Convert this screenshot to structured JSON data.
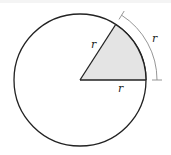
{
  "diagram": {
    "type": "circle-sector-radian",
    "circle": {
      "cx": 80,
      "cy": 80,
      "r": 66,
      "stroke": "#222222",
      "fill": "#ffffff"
    },
    "sector": {
      "angle_deg": 57.2958,
      "fill": "#e4e4e4",
      "stroke": "#222222"
    },
    "arc_marker": {
      "r": 77,
      "stroke": "#8a8a8a"
    },
    "labels": {
      "radius_upper": "r",
      "radius_lower": "r",
      "arc_length": "r"
    }
  }
}
